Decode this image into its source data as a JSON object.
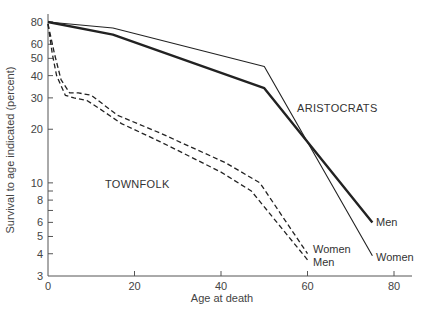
{
  "chart_data": {
    "type": "line",
    "title": "",
    "xlabel": "Age at death",
    "ylabel": "Survival to age indicated (percent)",
    "xlim": [
      0,
      82
    ],
    "ylim": [
      3,
      90
    ],
    "yscale": "log",
    "grid": false,
    "x_ticks": [
      0,
      20,
      40,
      60,
      80
    ],
    "y_ticks": [
      3,
      4,
      5,
      6,
      8,
      10,
      20,
      30,
      40,
      50,
      60,
      80
    ],
    "y_minor_ticks": [
      7,
      9
    ],
    "group_labels": [
      {
        "text": "ARISTOCRATS",
        "x": 58,
        "y": 24
      },
      {
        "text": "TOWNFOLK",
        "x": 13,
        "y": 14
      }
    ],
    "series": [
      {
        "name": "Aristocrats Men",
        "group": "ARISTOCRATS",
        "label": "Men",
        "style": "solid-thick",
        "x": [
          0,
          15,
          50,
          75
        ],
        "y": [
          80,
          68,
          34,
          6.0
        ]
      },
      {
        "name": "Aristocrats Women",
        "group": "ARISTOCRATS",
        "label": "Women",
        "style": "solid-thin",
        "x": [
          0,
          15,
          50,
          75
        ],
        "y": [
          80,
          74,
          45,
          3.9
        ]
      },
      {
        "name": "Townfolk Women",
        "group": "TOWNFOLK",
        "label": "Women",
        "style": "dashed",
        "x": [
          0,
          1.5,
          3,
          5,
          7,
          10,
          12,
          16,
          26,
          41,
          49,
          60
        ],
        "y": [
          78,
          53,
          38,
          32,
          32,
          31,
          28.5,
          24,
          19,
          13,
          10,
          4.0
        ]
      },
      {
        "name": "Townfolk Men",
        "group": "TOWNFOLK",
        "label": "Men",
        "style": "dashed",
        "x": [
          0,
          1,
          2,
          4,
          6,
          9,
          12,
          17,
          26,
          40,
          47,
          60
        ],
        "y": [
          78,
          53,
          40,
          31,
          30,
          29,
          26,
          21.5,
          17,
          11.5,
          9,
          3.7
        ]
      }
    ]
  },
  "labels": {
    "x_axis_title": "Age at death",
    "y_axis_title": "Survival to age indicated (percent)",
    "aristocrats": "ARISTOCRATS",
    "townfolk": "TOWNFOLK",
    "aristocrats_men": "Men",
    "aristocrats_women": "Women",
    "townfolk_women": "Women",
    "townfolk_men": "Men"
  },
  "colors": {
    "axis": "#555555",
    "line": "#222222",
    "text": "#333333"
  }
}
